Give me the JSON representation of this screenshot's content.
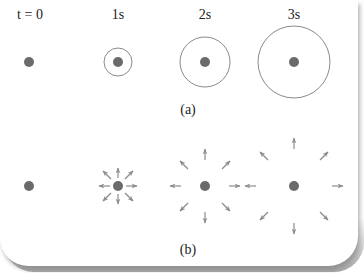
{
  "figure": {
    "time_labels": [
      "t = 0",
      "1s",
      "2s",
      "3s"
    ],
    "panel_a_label": "(a)",
    "panel_b_label": "(b)",
    "colors": {
      "dot": "#6b6b6b",
      "circle": "#8a8a8a",
      "arrow": "#8c8c8c",
      "text": "#222222"
    },
    "panel_a": {
      "description": "Expanding circular wavefronts around a point source",
      "circles": [
        {
          "time": "t = 0",
          "radius": 0
        },
        {
          "time": "1s",
          "radius": 14
        },
        {
          "time": "2s",
          "radius": 25
        },
        {
          "time": "3s",
          "radius": 36
        }
      ]
    },
    "panel_b": {
      "description": "Eight radial arrows moving outward from point source over time",
      "arrow_rings": [
        {
          "time": "t = 0",
          "distance": 0,
          "arrows": 0
        },
        {
          "time": "1s",
          "distance": 22,
          "arrows": 8
        },
        {
          "time": "2s",
          "distance": 34,
          "arrows": 8
        },
        {
          "time": "3s",
          "distance": 48,
          "arrows": 8
        }
      ]
    }
  }
}
